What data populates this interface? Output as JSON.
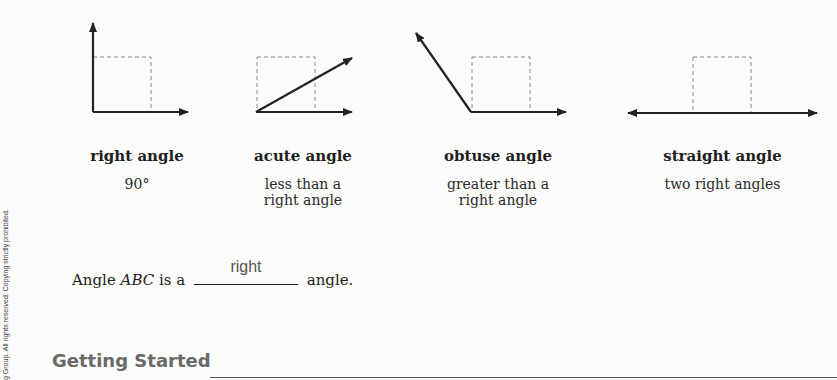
{
  "figures": [
    {
      "id": "right",
      "name": "right angle",
      "description_lines": [
        "90°"
      ]
    },
    {
      "id": "acute",
      "name": "acute angle",
      "description_lines": [
        "less than a",
        "right angle"
      ]
    },
    {
      "id": "obtuse",
      "name": "obtuse angle",
      "description_lines": [
        "greater than a",
        "right angle"
      ]
    },
    {
      "id": "straight",
      "name": "straight angle",
      "description_lines": [
        "two right angles"
      ]
    }
  ],
  "question": {
    "prefix": "Angle ",
    "angle_name": "ABC",
    "middle": " is a",
    "answer": "right",
    "suffix": "angle."
  },
  "section": {
    "title": "Getting Started"
  },
  "margin_note": "g Group. All rights reserved. Copying strictly prohibited.",
  "colors": {
    "ink": "#222222",
    "dashed": "#8a8a8a",
    "answer": "#555555",
    "section_heading": "#6a6a6a"
  }
}
